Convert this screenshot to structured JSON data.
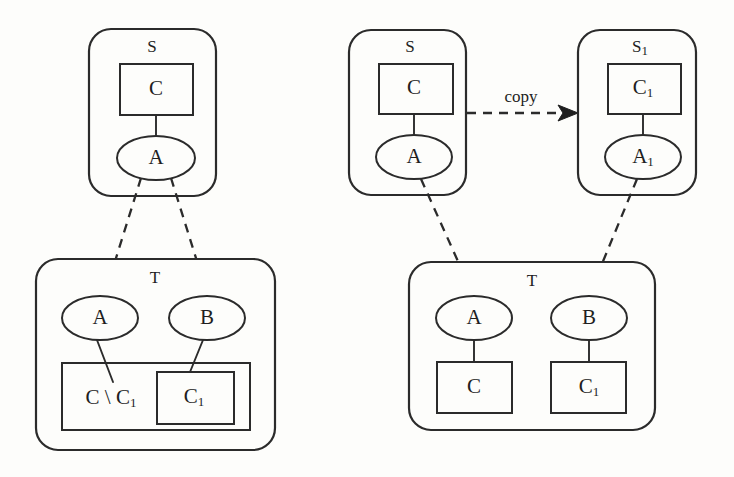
{
  "figure": {
    "title": "",
    "background_color": "#fdfdfb",
    "ink_color": "#2b2b2b"
  },
  "panels": [
    {
      "id": "left",
      "name": "before-copy",
      "source_container": {
        "label": "S",
        "class_box": {
          "label": "C"
        },
        "instance_ellipse": {
          "label": "A"
        }
      },
      "target_container": {
        "label": "T",
        "instances": [
          {
            "label": "A"
          },
          {
            "label": "B"
          }
        ],
        "outer_class_box": {
          "label": "C \\ C",
          "label_sub": "1"
        },
        "inner_class_box": {
          "label": "C",
          "label_sub": "1"
        }
      }
    },
    {
      "id": "right",
      "name": "after-copy",
      "source_container": {
        "label": "S",
        "class_box": {
          "label": "C"
        },
        "instance_ellipse": {
          "label": "A"
        }
      },
      "copy_container": {
        "label": "S",
        "label_sub": "1",
        "class_box": {
          "label": "C",
          "label_sub": "1"
        },
        "instance_ellipse": {
          "label": "A",
          "label_sub": "1"
        }
      },
      "target_container": {
        "label": "T",
        "instances": [
          {
            "label": "A"
          },
          {
            "label": "B"
          }
        ],
        "class_boxes": [
          {
            "label": "C",
            "label_sub": ""
          },
          {
            "label": "C",
            "label_sub": "1"
          }
        ]
      },
      "copy_edge": {
        "label": "copy"
      }
    }
  ],
  "labels": {
    "S": "S",
    "S1_base": "S",
    "S1_sub": "1",
    "T": "T",
    "A": "A",
    "A1_base": "A",
    "A1_sub": "1",
    "B": "B",
    "C": "C",
    "C1_base": "C",
    "C1_sub": "1",
    "C_minus_C1_base": "C \\ C",
    "C_minus_C1_sub": "1",
    "copy": "copy"
  }
}
